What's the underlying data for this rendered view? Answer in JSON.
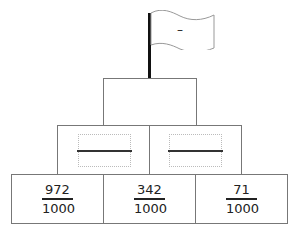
{
  "flag": {
    "label": "–",
    "icon": "flag-icon"
  },
  "top_box": {
    "value": ""
  },
  "middle_row": [
    {
      "value": "",
      "placeholder": ""
    },
    {
      "value": "",
      "placeholder": ""
    }
  ],
  "bottom_row": [
    {
      "numerator": "972",
      "denominator": "1000"
    },
    {
      "numerator": "342",
      "denominator": "1000"
    },
    {
      "numerator": "71",
      "denominator": "1000"
    }
  ]
}
